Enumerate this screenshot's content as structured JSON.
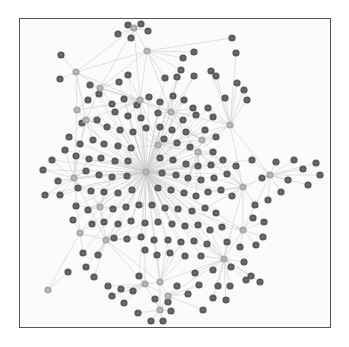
{
  "figure": {
    "type": "network-graph",
    "frame": {
      "x": 19,
      "y": 18,
      "w": 312,
      "h": 310,
      "border": "#555555",
      "bg": "#fbfbfb"
    },
    "colors": {
      "node": "#5a5a5a",
      "node_core": "#6e6e6e",
      "hub": "#a8a8a8",
      "hub_core": "#bdbdbd",
      "edge": "#c8c8c8"
    },
    "hubs": [
      [
        146,
        172
      ],
      [
        74,
        178
      ],
      [
        100,
        207
      ],
      [
        106,
        240
      ],
      [
        145,
        284
      ],
      [
        160,
        282
      ],
      [
        168,
        296
      ],
      [
        243,
        230
      ],
      [
        243,
        187
      ],
      [
        224,
        259
      ],
      [
        270,
        175
      ],
      [
        230,
        125
      ],
      [
        171,
        112
      ],
      [
        134,
        28
      ],
      [
        100,
        88
      ],
      [
        77,
        110
      ],
      [
        86,
        120
      ],
      [
        140,
        100
      ],
      [
        158,
        145
      ],
      [
        76,
        72
      ],
      [
        160,
        310
      ],
      [
        48,
        290
      ],
      [
        80,
        233
      ],
      [
        147,
        51
      ],
      [
        202,
        140
      ],
      [
        198,
        152
      ]
    ],
    "nodes": [
      [
        128,
        25
      ],
      [
        141,
        24
      ],
      [
        118,
        34
      ],
      [
        131,
        38
      ],
      [
        148,
        31
      ],
      [
        61,
        55
      ],
      [
        60,
        79
      ],
      [
        90,
        85
      ],
      [
        128,
        75
      ],
      [
        119,
        82
      ],
      [
        183,
        58
      ],
      [
        194,
        52
      ],
      [
        181,
        70
      ],
      [
        211,
        71
      ],
      [
        232,
        38
      ],
      [
        236,
        53
      ],
      [
        216,
        76
      ],
      [
        237,
        83
      ],
      [
        244,
        90
      ],
      [
        225,
        98
      ],
      [
        247,
        100
      ],
      [
        165,
        78
      ],
      [
        177,
        77
      ],
      [
        194,
        76
      ],
      [
        99,
        94
      ],
      [
        88,
        100
      ],
      [
        112,
        104
      ],
      [
        124,
        99
      ],
      [
        137,
        105
      ],
      [
        149,
        97
      ],
      [
        160,
        102
      ],
      [
        173,
        96
      ],
      [
        184,
        100
      ],
      [
        193,
        108
      ],
      [
        208,
        108
      ],
      [
        115,
        112
      ],
      [
        128,
        116
      ],
      [
        141,
        118
      ],
      [
        158,
        113
      ],
      [
        183,
        120
      ],
      [
        196,
        115
      ],
      [
        213,
        117
      ],
      [
        82,
        123
      ],
      [
        97,
        120
      ],
      [
        107,
        127
      ],
      [
        120,
        130
      ],
      [
        133,
        132
      ],
      [
        146,
        128
      ],
      [
        160,
        127
      ],
      [
        172,
        130
      ],
      [
        186,
        132
      ],
      [
        205,
        130
      ],
      [
        216,
        137
      ],
      [
        69,
        137
      ],
      [
        80,
        144
      ],
      [
        93,
        140
      ],
      [
        104,
        144
      ],
      [
        118,
        146
      ],
      [
        131,
        148
      ],
      [
        164,
        139
      ],
      [
        177,
        143
      ],
      [
        190,
        147
      ],
      [
        213,
        152
      ],
      [
        65,
        150
      ],
      [
        76,
        156
      ],
      [
        89,
        159
      ],
      [
        101,
        158
      ],
      [
        115,
        161
      ],
      [
        128,
        161
      ],
      [
        160,
        158
      ],
      [
        173,
        160
      ],
      [
        186,
        164
      ],
      [
        198,
        166
      ],
      [
        211,
        165
      ],
      [
        223,
        160
      ],
      [
        52,
        160
      ],
      [
        43,
        170
      ],
      [
        58,
        181
      ],
      [
        86,
        171
      ],
      [
        99,
        175
      ],
      [
        112,
        177
      ],
      [
        127,
        176
      ],
      [
        162,
        173
      ],
      [
        176,
        175
      ],
      [
        188,
        178
      ],
      [
        201,
        180
      ],
      [
        214,
        178
      ],
      [
        227,
        174
      ],
      [
        236,
        166
      ],
      [
        252,
        160
      ],
      [
        45,
        195
      ],
      [
        60,
        195
      ],
      [
        78,
        188
      ],
      [
        91,
        191
      ],
      [
        104,
        192
      ],
      [
        118,
        193
      ],
      [
        132,
        190
      ],
      [
        158,
        188
      ],
      [
        171,
        190
      ],
      [
        184,
        193
      ],
      [
        196,
        196
      ],
      [
        208,
        192
      ],
      [
        221,
        190
      ],
      [
        232,
        196
      ],
      [
        262,
        178
      ],
      [
        276,
        162
      ],
      [
        294,
        160
      ],
      [
        303,
        169
      ],
      [
        316,
        163
      ],
      [
        320,
        175
      ],
      [
        308,
        185
      ],
      [
        288,
        180
      ],
      [
        281,
        192
      ],
      [
        268,
        200
      ],
      [
        255,
        205
      ],
      [
        253,
        218
      ],
      [
        264,
        222
      ],
      [
        263,
        237
      ],
      [
        256,
        245
      ],
      [
        240,
        247
      ],
      [
        227,
        242
      ],
      [
        76,
        206
      ],
      [
        88,
        210
      ],
      [
        113,
        209
      ],
      [
        126,
        207
      ],
      [
        139,
        205
      ],
      [
        152,
        205
      ],
      [
        165,
        208
      ],
      [
        178,
        209
      ],
      [
        192,
        211
      ],
      [
        205,
        208
      ],
      [
        216,
        213
      ],
      [
        73,
        220
      ],
      [
        92,
        224
      ],
      [
        104,
        222
      ],
      [
        118,
        224
      ],
      [
        131,
        221
      ],
      [
        145,
        223
      ],
      [
        158,
        222
      ],
      [
        172,
        224
      ],
      [
        185,
        226
      ],
      [
        198,
        225
      ],
      [
        210,
        230
      ],
      [
        222,
        227
      ],
      [
        114,
        238
      ],
      [
        127,
        239
      ],
      [
        141,
        237
      ],
      [
        154,
        240
      ],
      [
        168,
        240
      ],
      [
        181,
        242
      ],
      [
        194,
        241
      ],
      [
        207,
        244
      ],
      [
        83,
        253
      ],
      [
        98,
        255
      ],
      [
        145,
        250
      ],
      [
        157,
        255
      ],
      [
        170,
        253
      ],
      [
        185,
        256
      ],
      [
        201,
        256
      ],
      [
        213,
        270
      ],
      [
        231,
        267
      ],
      [
        244,
        262
      ],
      [
        251,
        276
      ],
      [
        86,
        267
      ],
      [
        94,
        277
      ],
      [
        68,
        272
      ],
      [
        108,
        286
      ],
      [
        121,
        289
      ],
      [
        133,
        291
      ],
      [
        139,
        276
      ],
      [
        155,
        299
      ],
      [
        168,
        302
      ],
      [
        177,
        286
      ],
      [
        188,
        294
      ],
      [
        199,
        285
      ],
      [
        218,
        286
      ],
      [
        230,
        286
      ],
      [
        246,
        280
      ],
      [
        260,
        282
      ],
      [
        195,
        273
      ],
      [
        213,
        298
      ],
      [
        203,
        310
      ],
      [
        226,
        300
      ],
      [
        138,
        313
      ],
      [
        151,
        321
      ],
      [
        163,
        321
      ],
      [
        171,
        311
      ],
      [
        124,
        303
      ],
      [
        112,
        296
      ]
    ]
  }
}
